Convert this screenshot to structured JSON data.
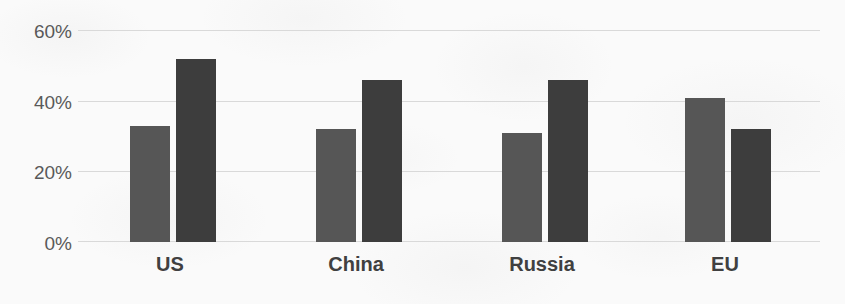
{
  "chart_data": {
    "type": "bar",
    "title": "",
    "subtitle": "",
    "xlabel": "",
    "ylabel": "",
    "categories": [
      "US",
      "China",
      "Russia",
      "EU"
    ],
    "series": [
      {
        "name": "series-a",
        "color": "#565656",
        "values": [
          33,
          32,
          31,
          41
        ]
      },
      {
        "name": "series-b",
        "color": "#3d3d3d",
        "values": [
          52,
          46,
          46,
          32
        ]
      }
    ],
    "ylim": [
      0,
      60
    ],
    "ytick_labels": [
      "0%",
      "20%",
      "40%",
      "60%"
    ],
    "ytick_values": [
      0,
      20,
      40,
      60
    ],
    "grid": true,
    "legend": "none",
    "annotations": []
  },
  "axis": {
    "ticks": [
      {
        "label": "60%",
        "value": 60
      },
      {
        "label": "40%",
        "value": 40
      },
      {
        "label": "20%",
        "value": 20
      },
      {
        "label": "0%",
        "value": 0
      }
    ]
  },
  "groups": [
    {
      "label": "US",
      "a": 33,
      "b": 52
    },
    {
      "label": "China",
      "a": 32,
      "b": 46
    },
    {
      "label": "Russia",
      "a": 31,
      "b": 46
    },
    {
      "label": "EU",
      "a": 41,
      "b": 32
    }
  ],
  "colors": {
    "series_a": "#565656",
    "series_b": "#3d3d3d",
    "gridline": "#d9d9d9",
    "axis_label": "#595959",
    "category_label": "#404040",
    "background": "#fafafa"
  }
}
